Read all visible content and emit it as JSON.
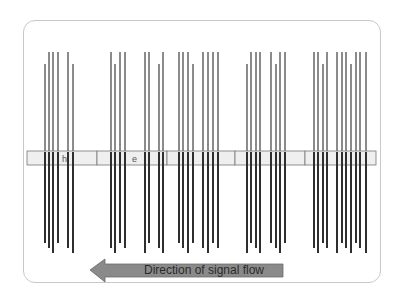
{
  "diagram": {
    "title": "",
    "band": {
      "segments": [
        {
          "label": "h",
          "x": 27,
          "w": 70
        },
        {
          "label": "e",
          "x": 97,
          "w": 70
        },
        {
          "label": "l",
          "x": 167,
          "w": 68
        },
        {
          "label": "",
          "x": 235,
          "w": 70
        },
        {
          "label": "",
          "x": 305,
          "w": 71
        }
      ],
      "y": 151,
      "height": 14,
      "fill": "#efefef",
      "stroke": "#777777"
    },
    "arrow": {
      "label": "Direction of signal flow",
      "direction": "left",
      "fill": "#8a8a8a",
      "stroke": "#6a6a6a"
    },
    "spike_groups": [
      {
        "xs": [
          45,
          49,
          53,
          58,
          68,
          73
        ]
      },
      {
        "xs": [
          111,
          115,
          120,
          125
        ]
      },
      {
        "xs": [
          145,
          149,
          159,
          163
        ]
      },
      {
        "xs": [
          179,
          183,
          188,
          193
        ]
      },
      {
        "xs": [
          203,
          208,
          213,
          218
        ]
      },
      {
        "xs": [
          247,
          251,
          256,
          260
        ]
      },
      {
        "xs": [
          271,
          276,
          280,
          285
        ]
      },
      {
        "xs": [
          314,
          318,
          323,
          327
        ]
      },
      {
        "xs": [
          337,
          342,
          346,
          351,
          356,
          360,
          366
        ]
      }
    ],
    "spike_color": "#2e2e2e",
    "frame_color": "#c8c8c8"
  }
}
